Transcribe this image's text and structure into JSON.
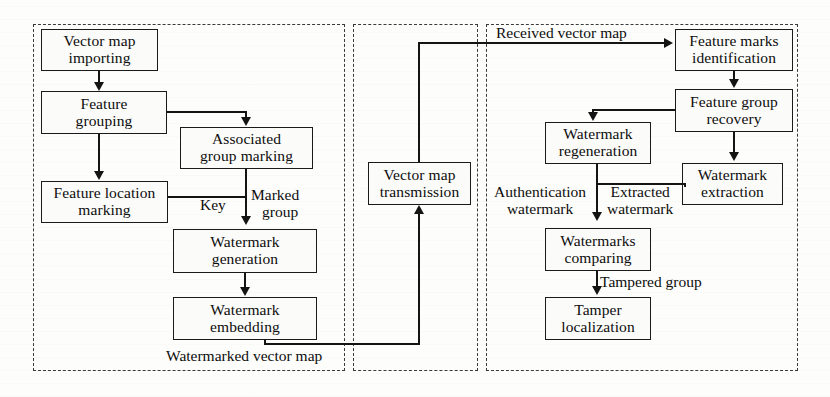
{
  "figure": {
    "panels": [
      {
        "id": "embedding-panel",
        "name": "watermark-embedding-panel"
      },
      {
        "id": "transmission-panel",
        "name": "vector-map-transmission-panel"
      },
      {
        "id": "detection-panel",
        "name": "watermark-detection-panel"
      }
    ]
  },
  "nodes": {
    "vector_map_importing": {
      "line1": "Vector map",
      "line2": "importing"
    },
    "feature_grouping": {
      "line1": "Feature",
      "line2": "grouping"
    },
    "associated_group_marking": {
      "line1": "Associated",
      "line2": "group marking"
    },
    "feature_location_marking": {
      "line1": "Feature location",
      "line2": "marking"
    },
    "watermark_generation": {
      "line1": "Watermark",
      "line2": "generation"
    },
    "watermark_embedding": {
      "line1": "Watermark",
      "line2": "embedding"
    },
    "vector_map_transmission": {
      "line1": "Vector map",
      "line2": "transmission"
    },
    "feature_marks_identification": {
      "line1": "Feature marks",
      "line2": "identification"
    },
    "feature_group_recovery": {
      "line1": "Feature group",
      "line2": "recovery"
    },
    "watermark_regeneration": {
      "line1": "Watermark",
      "line2": "regeneration"
    },
    "watermark_extraction": {
      "line1": "Watermark",
      "line2": "extraction"
    },
    "watermarks_comparing": {
      "line1": "Watermarks",
      "line2": "comparing"
    },
    "tamper_localization": {
      "line1": "Tamper",
      "line2": "localization"
    }
  },
  "edge_labels": {
    "key": "Key",
    "marked_group_l1": "Marked",
    "marked_group_l2": "group",
    "watermarked_vector_map": "Watermarked vector map",
    "received_vector_map": "Received vector map",
    "authentication_l1": "Authentication",
    "authentication_l2": "watermark",
    "extracted_l1": "Extracted",
    "extracted_l2": "watermark",
    "tampered_group": "Tampered group"
  },
  "colors": {
    "ink": "#141414",
    "box_border": "#1a1a1a",
    "panel_border": "#3a3a3a",
    "page_background": "#fdfdfb"
  }
}
